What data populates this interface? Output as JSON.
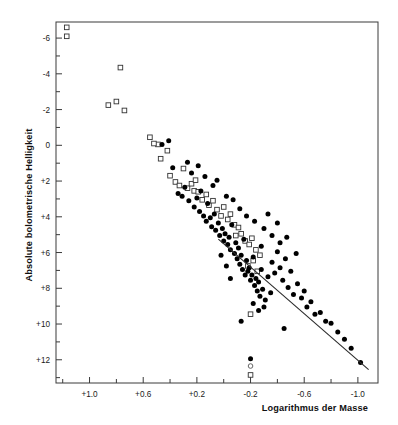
{
  "chart_data": {
    "type": "scatter",
    "title": "",
    "xlabel": "Logarithmus der Masse",
    "ylabel": "Absolute bolometrische Helligkeit",
    "xlim": [
      1.25,
      -1.15
    ],
    "ylim": [
      13.3,
      -6.9
    ],
    "x_axis_reversed": true,
    "y_axis_inverted": true,
    "grid": false,
    "legend_position": "none",
    "xticks_labeled": [
      {
        "value": 1.0,
        "label": "+1.0"
      },
      {
        "value": 0.6,
        "label": "+0.6"
      },
      {
        "value": 0.2,
        "label": "+0.2"
      },
      {
        "value": -0.2,
        "label": "-0.2"
      },
      {
        "value": -0.6,
        "label": "-0.6"
      },
      {
        "value": -1.0,
        "label": "-1.0"
      }
    ],
    "xticks_minor": [
      1.2,
      0.8,
      0.4,
      0.0,
      -0.4,
      -0.8
    ],
    "yticks_labeled": [
      {
        "value": -6,
        "label": "-6"
      },
      {
        "value": -4,
        "label": "-4"
      },
      {
        "value": -2,
        "label": "-2"
      },
      {
        "value": 0,
        "label": "0"
      },
      {
        "value": 2,
        "label": "+2"
      },
      {
        "value": 4,
        "label": "+4"
      },
      {
        "value": 6,
        "label": "+6"
      },
      {
        "value": 8,
        "label": "+8"
      },
      {
        "value": 10,
        "label": "+10"
      },
      {
        "value": 12,
        "label": "+12"
      }
    ],
    "yticks_minor": [
      -5,
      -3,
      -1,
      1,
      3,
      5,
      7,
      9,
      11,
      13
    ],
    "series": [
      {
        "name": "open-squares",
        "marker": "open-square",
        "points": [
          [
            1.17,
            -6.6
          ],
          [
            1.17,
            -6.1
          ],
          [
            0.77,
            -4.35
          ],
          [
            0.86,
            -2.25
          ],
          [
            0.8,
            -2.45
          ],
          [
            0.74,
            -1.95
          ],
          [
            0.47,
            0.75
          ],
          [
            0.49,
            -0.05
          ],
          [
            0.52,
            -0.1
          ],
          [
            0.55,
            -0.45
          ],
          [
            0.42,
            0.3
          ],
          [
            0.4,
            1.7
          ],
          [
            0.36,
            2.05
          ],
          [
            0.33,
            2.25
          ],
          [
            0.3,
            1.3
          ],
          [
            0.27,
            2.4
          ],
          [
            0.24,
            2.15
          ],
          [
            0.22,
            2.55
          ],
          [
            0.21,
            1.95
          ],
          [
            0.19,
            2.6
          ],
          [
            0.16,
            3.05
          ],
          [
            0.13,
            2.75
          ],
          [
            0.11,
            3.35
          ],
          [
            0.08,
            3.1
          ],
          [
            0.05,
            3.6
          ],
          [
            0.02,
            3.95
          ],
          [
            0.0,
            3.45
          ],
          [
            -0.03,
            4.15
          ],
          [
            -0.05,
            3.85
          ],
          [
            -0.08,
            4.45
          ],
          [
            -0.11,
            4.6
          ],
          [
            -0.09,
            5.05
          ],
          [
            -0.13,
            4.95
          ],
          [
            -0.16,
            5.35
          ],
          [
            -0.19,
            5.55
          ],
          [
            -0.21,
            5.2
          ],
          [
            -0.24,
            5.85
          ],
          [
            -0.27,
            6.15
          ],
          [
            -0.22,
            6.45
          ],
          [
            -0.18,
            6.75
          ],
          [
            -0.25,
            7.05
          ],
          [
            -0.2,
            9.45
          ],
          [
            -0.2,
            12.85
          ]
        ]
      },
      {
        "name": "filled-circles",
        "marker": "filled-circle",
        "points": [
          [
            0.46,
            -0.05
          ],
          [
            0.41,
            -0.25
          ],
          [
            0.38,
            1.25
          ],
          [
            0.34,
            2.7
          ],
          [
            0.31,
            2.85
          ],
          [
            0.29,
            2.35
          ],
          [
            0.26,
            3.1
          ],
          [
            0.24,
            1.55
          ],
          [
            0.22,
            3.45
          ],
          [
            0.2,
            2.95
          ],
          [
            0.18,
            3.7
          ],
          [
            0.17,
            2.55
          ],
          [
            0.15,
            3.95
          ],
          [
            0.13,
            4.25
          ],
          [
            0.12,
            3.25
          ],
          [
            0.1,
            4.05
          ],
          [
            0.09,
            4.55
          ],
          [
            0.07,
            3.85
          ],
          [
            0.06,
            4.75
          ],
          [
            0.04,
            4.35
          ],
          [
            0.03,
            5.05
          ],
          [
            0.01,
            4.65
          ],
          [
            0.0,
            5.35
          ],
          [
            -0.01,
            4.95
          ],
          [
            -0.03,
            5.55
          ],
          [
            -0.04,
            5.15
          ],
          [
            -0.05,
            5.85
          ],
          [
            -0.06,
            4.45
          ],
          [
            -0.08,
            6.05
          ],
          [
            -0.09,
            5.45
          ],
          [
            -0.1,
            6.35
          ],
          [
            -0.11,
            5.75
          ],
          [
            -0.12,
            6.65
          ],
          [
            -0.13,
            6.15
          ],
          [
            -0.14,
            6.95
          ],
          [
            -0.15,
            5.25
          ],
          [
            -0.16,
            7.25
          ],
          [
            -0.17,
            6.45
          ],
          [
            -0.18,
            7.05
          ],
          [
            -0.19,
            6.85
          ],
          [
            -0.2,
            7.55
          ],
          [
            -0.21,
            7.25
          ],
          [
            -0.22,
            6.25
          ],
          [
            -0.23,
            7.85
          ],
          [
            -0.24,
            7.45
          ],
          [
            -0.25,
            8.15
          ],
          [
            -0.26,
            7.65
          ],
          [
            -0.27,
            8.45
          ],
          [
            -0.28,
            6.95
          ],
          [
            -0.29,
            8.05
          ],
          [
            -0.31,
            8.65
          ],
          [
            -0.33,
            7.35
          ],
          [
            -0.35,
            8.25
          ],
          [
            -0.3,
            9.05
          ],
          [
            -0.26,
            9.25
          ],
          [
            -0.22,
            8.85
          ],
          [
            -0.36,
            6.55
          ],
          [
            -0.38,
            7.15
          ],
          [
            -0.4,
            5.95
          ],
          [
            -0.42,
            6.85
          ],
          [
            -0.44,
            7.55
          ],
          [
            -0.46,
            6.35
          ],
          [
            -0.48,
            7.95
          ],
          [
            -0.5,
            7.05
          ],
          [
            -0.52,
            8.35
          ],
          [
            -0.55,
            7.75
          ],
          [
            -0.58,
            8.55
          ],
          [
            -0.6,
            8.15
          ],
          [
            -0.62,
            9.05
          ],
          [
            -0.65,
            8.75
          ],
          [
            -0.68,
            9.45
          ],
          [
            -0.72,
            9.35
          ],
          [
            -0.76,
            9.85
          ],
          [
            -0.8,
            9.95
          ],
          [
            -0.85,
            10.45
          ],
          [
            -0.9,
            10.85
          ],
          [
            -0.95,
            11.35
          ],
          [
            -1.02,
            12.15
          ],
          [
            0.08,
            2.25
          ],
          [
            0.05,
            1.95
          ],
          [
            -0.02,
            2.85
          ],
          [
            -0.07,
            3.05
          ],
          [
            -0.12,
            3.55
          ],
          [
            -0.17,
            3.95
          ],
          [
            -0.23,
            4.25
          ],
          [
            -0.3,
            4.65
          ],
          [
            -0.36,
            5.05
          ],
          [
            -0.42,
            5.45
          ],
          [
            -0.47,
            5.15
          ],
          [
            -0.54,
            6.05
          ],
          [
            -0.33,
            3.85
          ],
          [
            -0.4,
            4.35
          ],
          [
            -0.28,
            5.65
          ],
          [
            0.19,
            1.15
          ],
          [
            0.14,
            1.75
          ],
          [
            0.27,
            0.95
          ],
          [
            -0.45,
            10.25
          ],
          [
            -0.2,
            11.95
          ],
          [
            -0.13,
            9.85
          ],
          [
            -0.05,
            7.45
          ],
          [
            -0.02,
            6.75
          ],
          [
            0.02,
            6.15
          ]
        ]
      },
      {
        "name": "open-circles",
        "marker": "open-circle",
        "points": [
          [
            -0.2,
            12.35
          ]
        ]
      }
    ],
    "fit_line": {
      "label": "Massen-Leuchtkraft-Beziehung",
      "x_start": 0.04,
      "y_start": 5.25,
      "x_end": -1.08,
      "y_end": 12.55
    }
  },
  "colors": {
    "background": "#ffffff",
    "axis": "#3a3a3a",
    "marker_filled": "#000000",
    "marker_open": "#333333",
    "fit_line": "#2b2b2b"
  }
}
